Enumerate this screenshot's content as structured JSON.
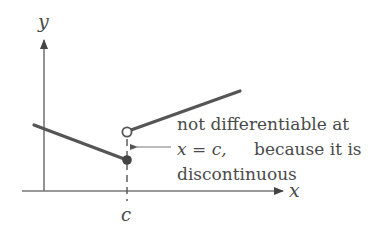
{
  "figure": {
    "axes": {
      "x_label": "x",
      "y_label": "y",
      "x_tick_label": "c"
    },
    "annotation": {
      "line1": "not differentiable at",
      "line2_math": "x = c,",
      "line2_text": "because it is",
      "line3": "discontinuous"
    },
    "colors": {
      "curve": "#555555",
      "axis": "#777777",
      "text": "#4a4a4a"
    }
  }
}
